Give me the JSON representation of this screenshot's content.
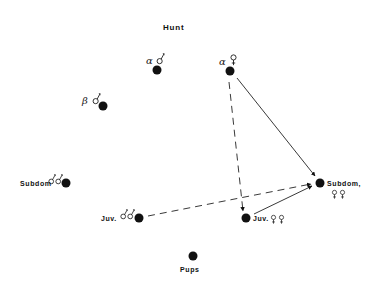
{
  "title": "Hunt",
  "nodes": [
    {
      "id": "alpha-male",
      "greek": "α",
      "symbols": "male",
      "label": "",
      "x": 157,
      "y": 70
    },
    {
      "id": "alpha-female",
      "greek": "α",
      "symbols": "female",
      "label": "",
      "x": 230,
      "y": 70
    },
    {
      "id": "beta-male",
      "greek": "β",
      "symbols": "male",
      "label": "",
      "x": 103,
      "y": 106
    },
    {
      "id": "subdom-males",
      "greek": "",
      "symbols": "male-male",
      "label": "Subdom",
      "x": 66,
      "y": 183
    },
    {
      "id": "juv-males",
      "greek": "",
      "symbols": "male-male",
      "label": "Juv.",
      "x": 139,
      "y": 218
    },
    {
      "id": "juv-females",
      "greek": "",
      "symbols": "female-female",
      "label": "Juv.",
      "x": 246,
      "y": 218
    },
    {
      "id": "subdom-females",
      "greek": "",
      "symbols": "female-female",
      "label": "Subdom,",
      "x": 320,
      "y": 183
    },
    {
      "id": "pups",
      "greek": "",
      "symbols": "",
      "label": "Pups",
      "x": 193,
      "y": 256
    }
  ],
  "labels": {
    "alpha_greek": "α",
    "beta_greek": "β",
    "subdom_males": "Subdom",
    "juv_males": "Juv.",
    "juv_females": "Juv.",
    "subdom_females": "Subdom,",
    "pups": "Pups"
  },
  "edges": [
    {
      "from": "alpha-female",
      "to": "subdom-females",
      "style": "solid"
    },
    {
      "from": "alpha-female",
      "to": "juv-females",
      "style": "dashed"
    },
    {
      "from": "juv-males",
      "to": "subdom-females",
      "style": "dashed"
    },
    {
      "from": "juv-females",
      "to": "subdom-females",
      "style": "solid"
    }
  ],
  "colors": {
    "ink": "#111111",
    "background": "#ffffff"
  }
}
